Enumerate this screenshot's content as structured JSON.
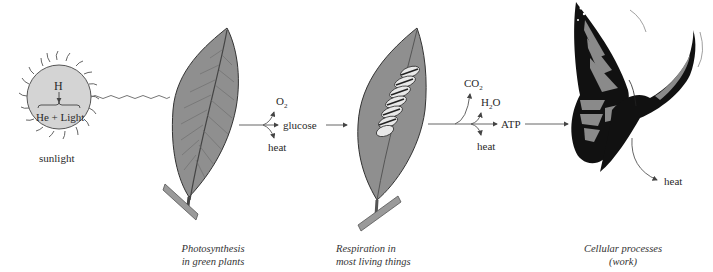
{
  "diagram": {
    "type": "energy-flow",
    "sun": {
      "input_label": "H",
      "output_label": "He + Light",
      "caption": "sunlight"
    },
    "stages": [
      {
        "id": "photosynthesis",
        "caption_line1": "Photosynthesis",
        "caption_line2": "in green plants"
      },
      {
        "id": "respiration",
        "caption_line1": "Respiration in",
        "caption_line2": "most living things"
      },
      {
        "id": "cellular",
        "caption_line1": "Cellular processes",
        "caption_line2": "(work)"
      }
    ],
    "outputs": {
      "photosynthesis": {
        "up": "O",
        "up_sub": "2",
        "down": "heat",
        "product": "glucose"
      },
      "respiration": {
        "co2": "CO",
        "co2_sub": "2",
        "h2o_a": "H",
        "h2o_sub": "2",
        "h2o_b": "O",
        "down": "heat",
        "product": "ATP"
      },
      "cellular": {
        "down": "heat"
      }
    },
    "colors": {
      "sun_fill": "#d4d4d4",
      "leaf_fill": "#8f8f8f",
      "line": "#555555",
      "butterfly_dark": "#111111",
      "butterfly_wing": "#8a8a8a"
    }
  }
}
